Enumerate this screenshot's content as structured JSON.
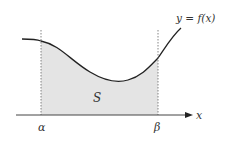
{
  "figure": {
    "curve_label": "y = f(x)",
    "region_label": "S",
    "x_axis_label": "x",
    "lower_bound_label": "α",
    "upper_bound_label": "β"
  },
  "colors": {
    "region_fill": "#e4e4e4",
    "curve": "#222222",
    "axis": "#444444",
    "dashed": "#666666"
  }
}
